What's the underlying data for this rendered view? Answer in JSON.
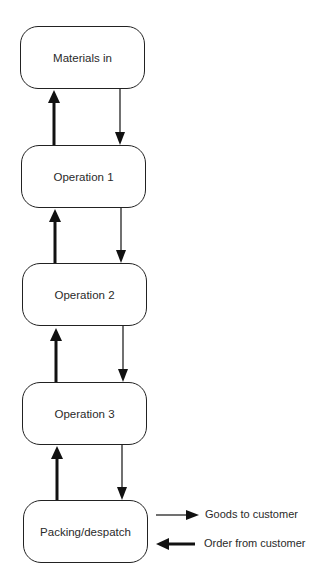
{
  "diagram": {
    "type": "flow",
    "nodes": [
      {
        "id": "materials",
        "label": "Materials in"
      },
      {
        "id": "op1",
        "label": "Operation 1"
      },
      {
        "id": "op2",
        "label": "Operation 2"
      },
      {
        "id": "op3",
        "label": "Operation 3"
      },
      {
        "id": "packing",
        "label": "Packing/despatch"
      }
    ],
    "edges": [
      {
        "from": "materials",
        "to": "op1",
        "style": "thin"
      },
      {
        "from": "op1",
        "to": "op2",
        "style": "thin"
      },
      {
        "from": "op2",
        "to": "op3",
        "style": "thin"
      },
      {
        "from": "op3",
        "to": "packing",
        "style": "thin"
      },
      {
        "from": "packing",
        "to": "op3",
        "style": "thick"
      },
      {
        "from": "op3",
        "to": "op2",
        "style": "thick"
      },
      {
        "from": "op2",
        "to": "op1",
        "style": "thick"
      },
      {
        "from": "op1",
        "to": "materials",
        "style": "thick"
      }
    ],
    "external": {
      "goods_out": "Goods to customer",
      "order_in": "Order from customer"
    }
  }
}
